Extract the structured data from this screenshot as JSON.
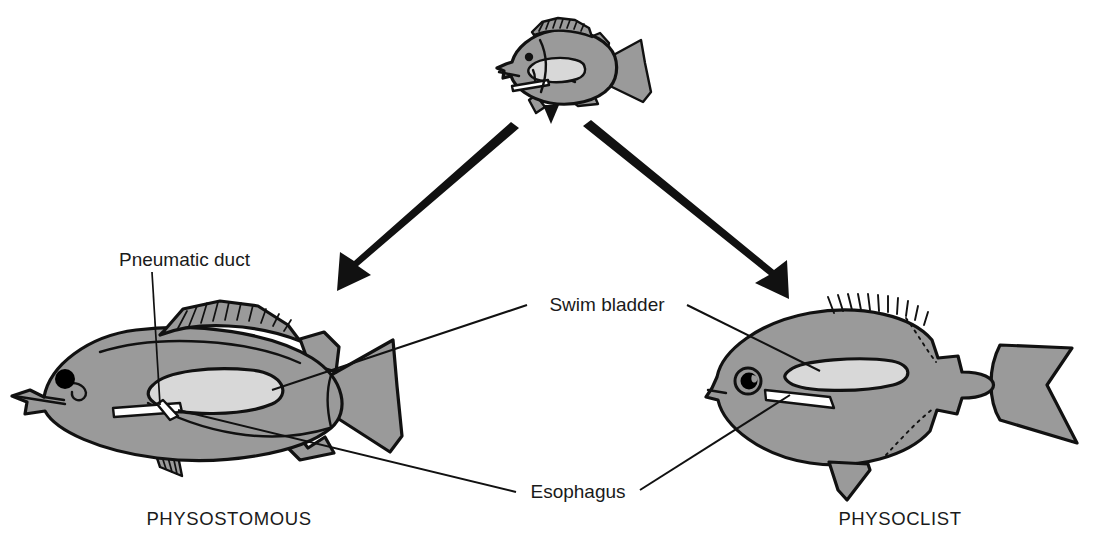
{
  "figure": {
    "kind": "biology-diagram",
    "background_color": "#ffffff"
  },
  "colors": {
    "body_fill": "#9a9a9a",
    "bladder_fill": "#d8d8d8",
    "outline": "#111111",
    "eye_fill": "#000000",
    "text": "#1a1a1a",
    "arrow": "#111111"
  },
  "captions": {
    "left": "PHYSOSTOMOUS",
    "right": "PHYSOCLIST"
  },
  "labels": {
    "pneumatic_duct": "Pneumatic duct",
    "swim_bladder": "Swim bladder",
    "esophagus": "Esophagus"
  },
  "nodes": {
    "ancestor": "generalized fish with pneumatic duct",
    "left_branch": "physostomous fish",
    "right_branch": "physoclist fish"
  },
  "arrows": [
    {
      "name": "arrow-to-physostomous",
      "direction": "down-left"
    },
    {
      "name": "arrow-to-physoclist",
      "direction": "down-right"
    }
  ],
  "leaders": [
    {
      "name": "pneumatic-duct-leader",
      "from": "Pneumatic duct",
      "to": "left fish duct"
    },
    {
      "name": "swim-bladder-leader-left",
      "from": "Swim bladder",
      "to": "left fish bladder"
    },
    {
      "name": "swim-bladder-leader-right",
      "from": "Swim bladder",
      "to": "right fish bladder"
    },
    {
      "name": "esophagus-leader-left",
      "from": "Esophagus",
      "to": "left fish esophagus"
    },
    {
      "name": "esophagus-leader-right",
      "from": "Esophagus",
      "to": "right fish esophagus"
    }
  ]
}
